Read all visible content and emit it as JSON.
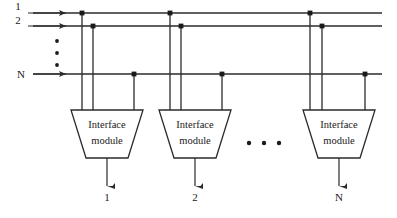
{
  "diagram": {
    "type": "block-diagram",
    "colors": {
      "background": "#ffffff",
      "line": "#2b2b2b",
      "text": "#1a1a1a",
      "junction": "#1a1a1a"
    },
    "bus_lines": [
      {
        "id": "line-1",
        "label": "1",
        "y": 13,
        "x_start": 33,
        "x_end": 382
      },
      {
        "id": "line-2",
        "label": "2",
        "y": 26,
        "x_start": 33,
        "x_end": 382
      },
      {
        "id": "line-n",
        "label": "N",
        "y": 74,
        "x_start": 33,
        "x_end": 382
      }
    ],
    "input_labels": {
      "line1": "1",
      "line2": "2",
      "lineN": "N"
    },
    "vertical_ellipsis": {
      "name": "vertical-ellipsis",
      "dots": 3,
      "x": 57,
      "y_values": [
        41,
        53,
        65
      ]
    },
    "horizontal_ellipsis": {
      "name": "horizontal-ellipsis",
      "dots": 3,
      "y": 143,
      "x_values": [
        249,
        264,
        279
      ]
    },
    "modules": [
      {
        "id": "module-1",
        "label_line1": "Interface",
        "label_line2": "module",
        "center_x": 107,
        "top_y": 110,
        "bottom_y": 158,
        "top_half_width": 36,
        "bottom_half_width": 21,
        "drops": [
          {
            "x": 82,
            "connects_to": "line-1",
            "y": 13
          },
          {
            "x": 93,
            "connects_to": "line-2",
            "y": 26
          },
          {
            "x": 134,
            "connects_to": "line-n",
            "y": 74
          }
        ],
        "output_label": "1",
        "output_x": 107,
        "output_arrow_end_y": 186
      },
      {
        "id": "module-2",
        "label_line1": "Interface",
        "label_line2": "module",
        "center_x": 195,
        "top_y": 110,
        "bottom_y": 158,
        "top_half_width": 36,
        "bottom_half_width": 21,
        "drops": [
          {
            "x": 170,
            "connects_to": "line-1",
            "y": 13
          },
          {
            "x": 181,
            "connects_to": "line-2",
            "y": 26
          },
          {
            "x": 222,
            "connects_to": "line-n",
            "y": 74
          }
        ],
        "output_label": "2",
        "output_x": 195,
        "output_arrow_end_y": 186
      },
      {
        "id": "module-n",
        "label_line1": "Interface",
        "label_line2": "module",
        "center_x": 339,
        "top_y": 110,
        "bottom_y": 158,
        "top_half_width": 36,
        "bottom_half_width": 21,
        "drops": [
          {
            "x": 310,
            "connects_to": "line-1",
            "y": 13
          },
          {
            "x": 322,
            "connects_to": "line-2",
            "y": 26
          },
          {
            "x": 365,
            "connects_to": "line-n",
            "y": 74
          }
        ],
        "output_label": "N",
        "output_x": 339,
        "output_arrow_end_y": 186
      }
    ],
    "output_labels": [
      {
        "text": "1",
        "x": 107,
        "y": 199
      },
      {
        "text": "2",
        "x": 195,
        "y": 199
      },
      {
        "text": "N",
        "x": 339,
        "y": 199
      }
    ]
  }
}
